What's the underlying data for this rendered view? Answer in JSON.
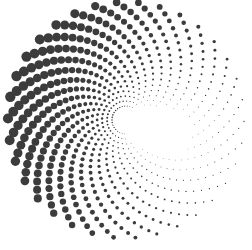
{
  "image": {
    "subject": "spiral halftone dot pattern",
    "background": "#ffffff",
    "dot_color": "#3c3c3c",
    "center": [
      126,
      120
    ],
    "arms": 34,
    "rings": 22,
    "inner_radius": 14,
    "outer_radius": 118,
    "max_dot_radius": 5.2,
    "twist": 2.6
  }
}
